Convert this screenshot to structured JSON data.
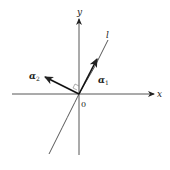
{
  "diagram": {
    "axes": {
      "x_label": "x",
      "y_label": "y",
      "origin_label": "0"
    },
    "line": {
      "label": "l"
    },
    "vectors": [
      {
        "name": "alpha1",
        "label_base": "α",
        "label_sub": "1"
      },
      {
        "name": "alpha2",
        "label_base": "α",
        "label_sub": "2"
      }
    ],
    "annotations": {
      "right_angle": "between α1 and α2"
    },
    "colors": {
      "stroke": "#222222",
      "background": "#ffffff"
    }
  }
}
